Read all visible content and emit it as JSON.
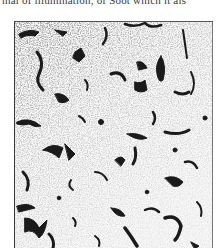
{
  "page": {
    "text_fragment": "mal of illumination, of Soot which it als",
    "figure": {
      "kind": "halftone micrograph",
      "description": "speckled gray field with scattered dark irregular flake-shaped inclusions",
      "colors": {
        "paper": "#ffffff",
        "ink": "#1a1a1a",
        "speckle": "#8a8a8a",
        "frame": "#3a3a3a"
      }
    }
  }
}
